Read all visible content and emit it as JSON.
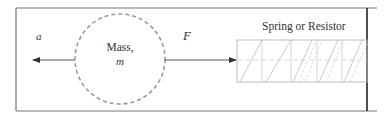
{
  "diagram": {
    "labels": {
      "acceleration": "a",
      "force": "F",
      "mass_line1": "Mass,",
      "mass_line2": "m",
      "spring": "Spring or Resistor"
    },
    "elements": {
      "mass": {
        "shape": "dashed-circle",
        "center": [
          120,
          59
        ],
        "radius": 45
      },
      "acceleration_arrow": {
        "direction": "left",
        "from": [
          75,
          60
        ],
        "to": [
          32,
          60
        ]
      },
      "force_arrow": {
        "direction": "right",
        "from": [
          165,
          60
        ],
        "to": [
          237,
          60
        ]
      },
      "spring_box": {
        "x": 237,
        "y": 40,
        "width": 130,
        "height": 42
      },
      "wall": {
        "x": 367
      }
    },
    "colors": {
      "frame": "#777777",
      "wall": "#222222",
      "circle": "#999999",
      "arrow": "#555555",
      "spring": "#bbbbbb",
      "text": "#333333"
    }
  }
}
